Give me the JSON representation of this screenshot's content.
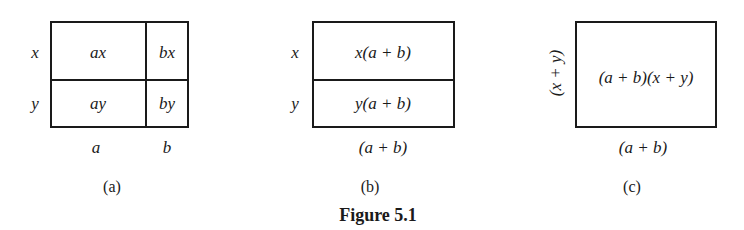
{
  "figure": {
    "caption": "Figure 5.1",
    "panels": [
      {
        "id": "a",
        "sublabel": "(a)",
        "row_labels": [
          "x",
          "y"
        ],
        "col_labels": [
          "a",
          "b"
        ],
        "cells": [
          [
            "ax",
            "bx"
          ],
          [
            "ay",
            "by"
          ]
        ]
      },
      {
        "id": "b",
        "sublabel": "(b)",
        "row_labels": [
          "x",
          "y"
        ],
        "col_label": "(a + b)",
        "cells": [
          "x(a + b)",
          "y(a + b)"
        ]
      },
      {
        "id": "c",
        "sublabel": "(c)",
        "side_label": "(x + y)",
        "col_label": "(a + b)",
        "cell": "(a + b)(x + y)"
      }
    ]
  }
}
